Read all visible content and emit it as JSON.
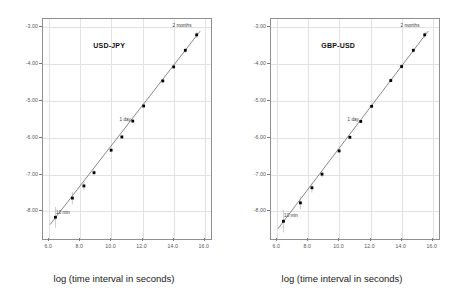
{
  "figure": {
    "background": "#ffffff",
    "frame_color": "#8f8f8f",
    "grid_color": "#e2e2e2",
    "marker_color": "#000000",
    "line_color": "#555555"
  },
  "chart_data": [
    {
      "type": "scatter",
      "title": "USD-JPY",
      "xlabel": "log (time interval in seconds)",
      "ylabel": "",
      "xlim": [
        5.6,
        16.4
      ],
      "ylim": [
        -8.75,
        -2.78
      ],
      "xticks": [
        6.0,
        8.0,
        10.0,
        12.0,
        14.0,
        16.0
      ],
      "xticklabels": [
        "6.0",
        "8.0",
        "10.0",
        "12.0",
        "14.0",
        "16.0"
      ],
      "yticks": [
        -3.0,
        -4.0,
        -5.0,
        -6.0,
        -7.0,
        -8.0
      ],
      "yticklabels": [
        "-3.00",
        "-4.00",
        "-5.00",
        "-6.00",
        "-7.00",
        "-8.00"
      ],
      "grid": true,
      "legend": "none",
      "x": [
        6.4,
        7.49,
        8.23,
        8.88,
        9.98,
        10.67,
        11.37,
        12.07,
        13.3,
        14.0,
        14.75,
        15.48
      ],
      "y": [
        -8.16,
        -7.64,
        -7.31,
        -6.95,
        -6.34,
        -5.98,
        -5.55,
        -5.14,
        -4.46,
        -4.08,
        -3.63,
        -3.21
      ],
      "yerr": [
        0.28,
        0.17,
        0.12,
        0.08,
        0.06,
        0.05,
        0.05,
        0.05,
        0.05,
        0.06,
        0.07,
        0.09
      ],
      "fit_line": {
        "x0": 6.05,
        "y0": -8.36,
        "x1": 15.7,
        "y1": -3.11
      },
      "annotations": [
        {
          "text": "10 min",
          "x": 6.95,
          "y": -8.04
        },
        {
          "text": "1 day",
          "x": 10.95,
          "y": -5.52
        },
        {
          "text": "2 months",
          "x": 14.6,
          "y": -2.98
        }
      ]
    },
    {
      "type": "scatter",
      "title": "GBP-USD",
      "xlabel": "log (time interval in seconds)",
      "ylabel": "",
      "xlim": [
        5.6,
        16.4
      ],
      "ylim": [
        -8.75,
        -2.78
      ],
      "xticks": [
        6.0,
        8.0,
        10.0,
        12.0,
        14.0,
        16.0
      ],
      "xticklabels": [
        "6.0",
        "8.0",
        "10.0",
        "12.0",
        "14.0",
        "16.0"
      ],
      "yticks": [
        -3.0,
        -4.0,
        -5.0,
        -6.0,
        -7.0,
        -8.0
      ],
      "yticklabels": [
        "-3.00",
        "-4.00",
        "-5.00",
        "-6.00",
        "-7.00",
        "-8.00"
      ],
      "grid": true,
      "legend": "none",
      "x": [
        6.4,
        7.49,
        8.23,
        8.88,
        9.98,
        10.67,
        11.37,
        12.07,
        13.3,
        14.0,
        14.75,
        15.48
      ],
      "y": [
        -8.27,
        -7.77,
        -7.36,
        -6.99,
        -6.36,
        -5.99,
        -5.56,
        -5.15,
        -4.45,
        -4.07,
        -3.63,
        -3.21
      ],
      "yerr": [
        0.3,
        0.18,
        0.13,
        0.08,
        0.06,
        0.05,
        0.05,
        0.05,
        0.05,
        0.06,
        0.07,
        0.09
      ],
      "fit_line": {
        "x0": 6.05,
        "y0": -8.47,
        "x1": 15.7,
        "y1": -3.11
      },
      "annotations": [
        {
          "text": "10 min",
          "x": 6.95,
          "y": -8.12
        },
        {
          "text": "1 day",
          "x": 10.95,
          "y": -5.53
        },
        {
          "text": "2 months",
          "x": 14.6,
          "y": -2.98
        }
      ]
    }
  ]
}
